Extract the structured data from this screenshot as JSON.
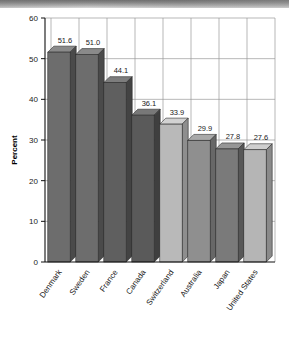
{
  "chart_data": {
    "type": "bar",
    "title": "",
    "xlabel": "",
    "ylabel": "Percent",
    "ylim": [
      0,
      60
    ],
    "yticks": [
      0,
      10,
      20,
      30,
      40,
      50,
      60
    ],
    "grid": "both",
    "legend": "none",
    "style": "3d-bar",
    "categories": [
      "Denmark",
      "Sweden",
      "France",
      "Canada",
      "Switzerland",
      "Australia",
      "Japan",
      "United States"
    ],
    "values": [
      51.6,
      51.0,
      44.1,
      36.1,
      33.9,
      29.9,
      27.8,
      27.6
    ],
    "value_labels": [
      "51.6",
      "51.0",
      "44.1",
      "36.1",
      "33.9",
      "29.9",
      "27.8",
      "27.6"
    ],
    "bar_colors": [
      "#6d6d6d",
      "#6d6d6d",
      "#5f5f5f",
      "#5a5a5a",
      "#b9b9b9",
      "#8f8f8f",
      "#7a7a7a",
      "#b5b5b5"
    ],
    "bar_top_colors": [
      "#8a8a8a",
      "#8a8a8a",
      "#7d7d7d",
      "#787878",
      "#d2d2d2",
      "#a9a9a9",
      "#969696",
      "#cfcfcf"
    ],
    "bar_side_colors": [
      "#4a4a4a",
      "#4a4a4a",
      "#434343",
      "#3f3f3f",
      "#8e8e8e",
      "#676767",
      "#575757",
      "#8a8a8a"
    ]
  },
  "axis": {
    "y_title": "Percent",
    "tick_60": "60",
    "tick_50": "50",
    "tick_40": "40",
    "tick_30": "30",
    "tick_20": "20",
    "tick_10": "10",
    "tick_0": "0"
  }
}
